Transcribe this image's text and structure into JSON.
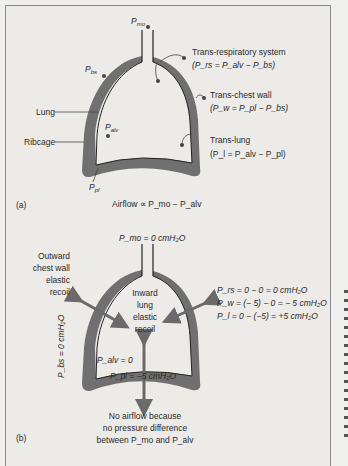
{
  "panel_a": {
    "label": "(a)",
    "pmo": "P",
    "pmo_sub": "mo",
    "pbs": "P",
    "pbs_sub": "bs",
    "palv": "P",
    "palv_sub": "alv",
    "ppl": "P",
    "ppl_sub": "pl",
    "lung": "Lung",
    "ribcage": "Ribcage",
    "trans_rs_title": "Trans-respiratory system",
    "trans_rs_eq": "(P_rs = P_alv − P_bs)",
    "trans_cw_title": "Trans-chest wall",
    "trans_cw_eq": "(P_w = P_pl − P_bs)",
    "trans_lung_title": "Trans-lung",
    "trans_lung_eq": "(P_l = P_alv − P_pl)",
    "airflow": "Airflow ∝ P_mo − P_alv"
  },
  "panel_b": {
    "label": "(b)",
    "pmo": "P_mo = 0 cmH₂O",
    "outward_1": "Outward",
    "outward_2": "chest wall",
    "outward_3": "elastic",
    "outward_4": "recoil",
    "inward_1": "Inward",
    "inward_2": "lung",
    "inward_3": "elastic",
    "inward_4": "recoil",
    "prs": "P_rs = 0 − 0 = 0 cmH₂O",
    "pw": "P_w = (− 5) − 0 = − 5 cmH₂O",
    "pl": "P_l = 0 − (−5) = +5 cmH₂O",
    "pbs": "P_bs = 0 cmH₂O",
    "palv": "P_alv = 0",
    "ppl": "P_pl = −5 cmH₂O",
    "no_airflow_1": "No airflow because",
    "no_airflow_2": "no pressure difference",
    "no_airflow_3": "between P_mo and P_alv"
  },
  "colors": {
    "wall": "#6f6f6f",
    "arrow": "#6a6a6a",
    "background": "#ecebe8",
    "text": "#2a2a2a"
  }
}
